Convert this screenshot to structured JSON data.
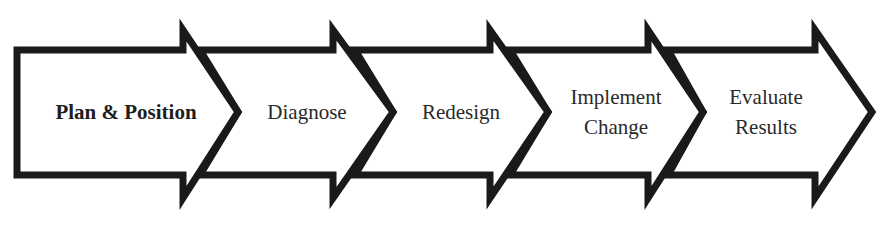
{
  "diagram": {
    "type": "process-chevron-flow",
    "stroke_color": "#1a1a1a",
    "fill_color": "#ffffff",
    "steps": [
      {
        "label_line1": "Plan & Position",
        "label_line2": "",
        "bold": true
      },
      {
        "label_line1": "Diagnose",
        "label_line2": "",
        "bold": false
      },
      {
        "label_line1": "Redesign",
        "label_line2": "",
        "bold": false
      },
      {
        "label_line1": "Implement",
        "label_line2": "Change",
        "bold": false
      },
      {
        "label_line1": "Evaluate",
        "label_line2": "Results",
        "bold": false
      }
    ]
  }
}
